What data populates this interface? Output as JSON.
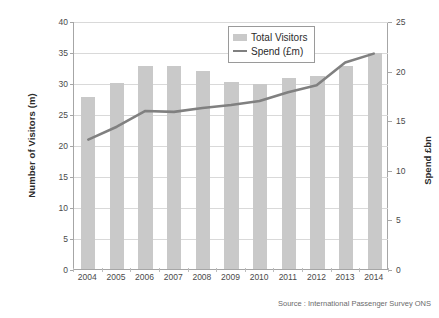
{
  "chart_data": {
    "type": "bar",
    "title": "",
    "subtitle": "",
    "xlabel": "",
    "ylabel": "Number of Visitors (m)",
    "y2label": "Spend £bn",
    "categories": [
      "2004",
      "2005",
      "2006",
      "2007",
      "2008",
      "2009",
      "2010",
      "2011",
      "2012",
      "2013",
      "2014"
    ],
    "ylim": [
      0,
      40
    ],
    "y2lim": [
      0,
      25
    ],
    "yticks": [
      0,
      5,
      10,
      15,
      20,
      25,
      30,
      35,
      40
    ],
    "y2ticks": [
      0,
      5,
      10,
      15,
      20,
      25
    ],
    "grid": "horizontal",
    "legend_position": "top-center",
    "series": [
      {
        "name": "Total Visitors",
        "type": "bar",
        "axis": "left",
        "color": "#c9c9c9",
        "values": [
          27.8,
          30.0,
          32.7,
          32.8,
          31.9,
          30.1,
          29.8,
          30.8,
          31.1,
          32.8,
          34.9
        ]
      },
      {
        "name": "Spend (£m)",
        "type": "line",
        "axis": "right",
        "color": "#808080",
        "values": [
          13.1,
          14.4,
          16.0,
          15.9,
          16.3,
          16.6,
          17.0,
          17.9,
          18.6,
          20.9,
          21.8
        ]
      }
    ],
    "annotations": [
      "Source : International Passenger Survey ONS"
    ]
  },
  "axes": {
    "left_title": "Number of Visitors (m)",
    "right_title": "Spend £bn"
  },
  "legend": {
    "items": [
      {
        "label": "Total Visitors",
        "marker": "bar-swatch"
      },
      {
        "label": "Spend (£m)",
        "marker": "line-swatch"
      }
    ]
  },
  "footer": {
    "source": "Source : International Passenger Survey ONS"
  },
  "colors": {
    "bar": "#c9c9c9",
    "line": "#808080",
    "grid": "#d9d9d9",
    "axis": "#a6a6a6",
    "text": "#4a4a4a",
    "background": "#ffffff"
  }
}
